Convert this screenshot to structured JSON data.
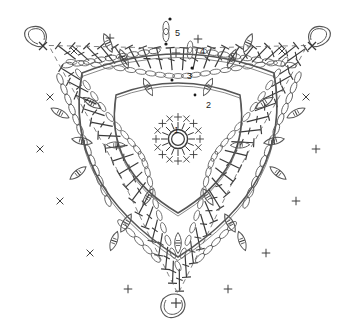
{
  "document": {
    "title": "Crochet Triangle Motif Chart",
    "type": "crochet-stitch-diagram",
    "background_color": "#ffffff",
    "line_color": "#3a3a3a",
    "shape_outline_color": "#555555"
  },
  "chart_data": {
    "type": "diagram",
    "shape": "triangle",
    "round_labels": [
      "1",
      "2",
      "3",
      "4",
      "5"
    ],
    "rounds": [
      {
        "number": "1",
        "name": "center-ring",
        "stitches": "8 single crochet in magic ring",
        "symbols": [
          "+",
          "x"
        ]
      },
      {
        "number": "2",
        "name": "puff-round",
        "stitches": "puff stitches with chain spaces",
        "symbols": [
          "puff",
          "chain"
        ]
      },
      {
        "number": "3",
        "name": "puff-round-2",
        "stitches": "puff stitches and chains",
        "symbols": [
          "puff",
          "chain"
        ]
      },
      {
        "number": "4",
        "name": "chain-round",
        "stitches": "chain loops and single crochet",
        "symbols": [
          "chain",
          "+"
        ]
      },
      {
        "number": "5",
        "name": "treble-border",
        "stitches": "treble crochet fan border",
        "symbols": [
          "treble"
        ]
      }
    ],
    "legend": [
      {
        "symbol": "o",
        "name": "chain stitch"
      },
      {
        "symbol": "+",
        "name": "single crochet"
      },
      {
        "symbol": "x",
        "name": "single crochet"
      },
      {
        "symbol": "leaf",
        "name": "puff / bobble stitch"
      },
      {
        "symbol": "T",
        "name": "treble crochet"
      }
    ]
  },
  "labels": {
    "r1": "1",
    "r2": "2",
    "r3": "3",
    "r4": "4",
    "r5": "5"
  }
}
